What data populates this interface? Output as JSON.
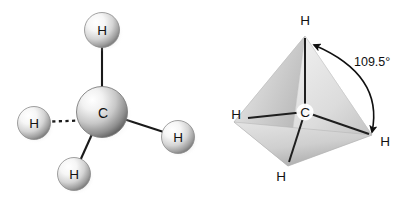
{
  "figure": {
    "background_color": "#ffffff"
  },
  "panels": [
    {
      "id": "ball-and-stick",
      "name": "Ball-and-stick model of methane",
      "center_atom": {
        "symbol": "C",
        "name": "carbon"
      },
      "atoms": [
        {
          "symbol": "H",
          "name": "hydrogen-top",
          "bond_style": "solid"
        },
        {
          "symbol": "H",
          "name": "hydrogen-left",
          "bond_style": "dashed"
        },
        {
          "symbol": "H",
          "name": "hydrogen-right",
          "bond_style": "solid"
        },
        {
          "symbol": "H",
          "name": "hydrogen-bottom",
          "bond_style": "solid"
        }
      ]
    },
    {
      "id": "tetrahedron",
      "name": "Tetrahedral geometry of methane",
      "center_atom": {
        "symbol": "C",
        "name": "carbon"
      },
      "vertices": [
        {
          "symbol": "H",
          "name": "hydrogen-apex"
        },
        {
          "symbol": "H",
          "name": "hydrogen-left"
        },
        {
          "symbol": "H",
          "name": "hydrogen-right"
        },
        {
          "symbol": "H",
          "name": "hydrogen-front"
        }
      ],
      "annotation": {
        "angle_label": "109.5°",
        "name": "bond-angle"
      }
    }
  ],
  "colors": {
    "bond": "#1a1a1a",
    "label": "#121212",
    "sphere_light": "#ffffff",
    "sphere_mid": "#c9c9c9",
    "sphere_dark": "#6e6e6e",
    "face_light": "#f2f2f2",
    "face_mid": "#d8d8d8",
    "face_dark": "#a8a8a8"
  }
}
